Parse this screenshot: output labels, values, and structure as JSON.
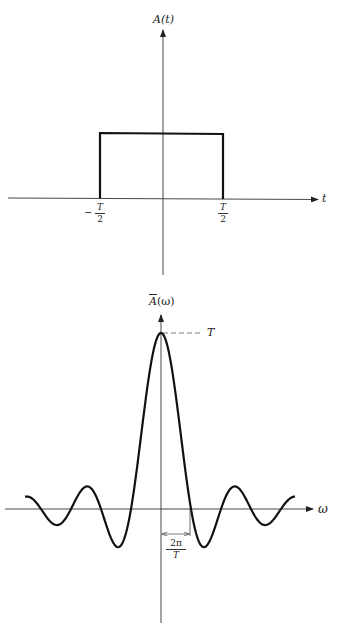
{
  "chart_data": [
    {
      "type": "line",
      "title": "",
      "ylabel": "A(t)",
      "xlabel": "t",
      "description": "Rectangular pulse of height 1 from -T/2 to T/2",
      "x_ticks": [
        {
          "label_num": "T",
          "label_den": "2",
          "sign": "−",
          "value": "-T/2"
        },
        {
          "label_num": "T",
          "label_den": "2",
          "sign": "",
          "value": "T/2"
        }
      ],
      "x": [
        "-inf",
        "-T/2",
        "-T/2",
        "T/2",
        "T/2",
        "inf"
      ],
      "y": [
        0,
        0,
        1,
        1,
        0,
        0
      ],
      "grid": false
    },
    {
      "type": "line",
      "title": "",
      "ylabel": "Ā(ω)",
      "xlabel": "ω",
      "description": "Sinc-shaped Fourier transform with peak T at ω=0, first zeros at ±2π/T",
      "peak_label": "T",
      "peak_value": "T",
      "dimension_label_num": "2π",
      "dimension_label_den": "T",
      "x_units": "2π/T",
      "x": [
        -4.5,
        -4,
        -3.5,
        -3,
        -2.5,
        -2,
        -1.5,
        -1,
        -0.5,
        0,
        0.5,
        1,
        1.5,
        2,
        2.5,
        3,
        3.5,
        4,
        4.5
      ],
      "y": [
        0.07,
        0,
        -0.09,
        0,
        0.13,
        0,
        -0.21,
        0,
        0.64,
        1,
        0.64,
        0,
        -0.21,
        0,
        0.13,
        0,
        -0.09,
        0,
        0.07
      ],
      "grid": false
    }
  ],
  "top": {
    "y_label": "A(t)",
    "x_label": "t",
    "left_tick": {
      "sign": "−",
      "num": "T",
      "den": "2"
    },
    "right_tick": {
      "num": "T",
      "den": "2"
    }
  },
  "bottom": {
    "y_label_base": "A",
    "y_label_arg": "(ω)",
    "x_label": "ω",
    "peak_label": "T",
    "dim_num": "2π",
    "dim_den": "T"
  }
}
